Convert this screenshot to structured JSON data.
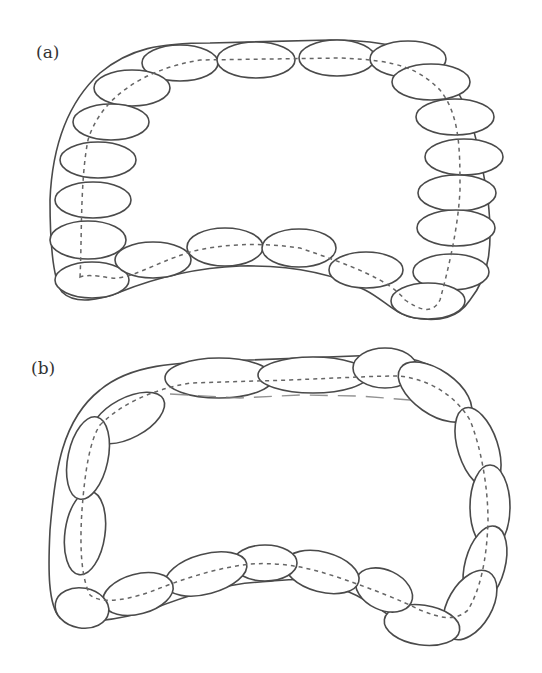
{
  "panels": [
    {
      "label": "(a)",
      "description": "Closed chain of horizontally oriented ellipses within a rounded outline with a concave bottom edge; dashed centerline threads through ellipse centers"
    },
    {
      "label": "(b)",
      "description": "Closed chain of elongated ellipses aligned tangentially along the outline; dashed centerline threads through ellipse centers"
    }
  ],
  "colors": {
    "stroke": "#4a4a4a",
    "dashed": "#666666",
    "background": "#ffffff"
  }
}
